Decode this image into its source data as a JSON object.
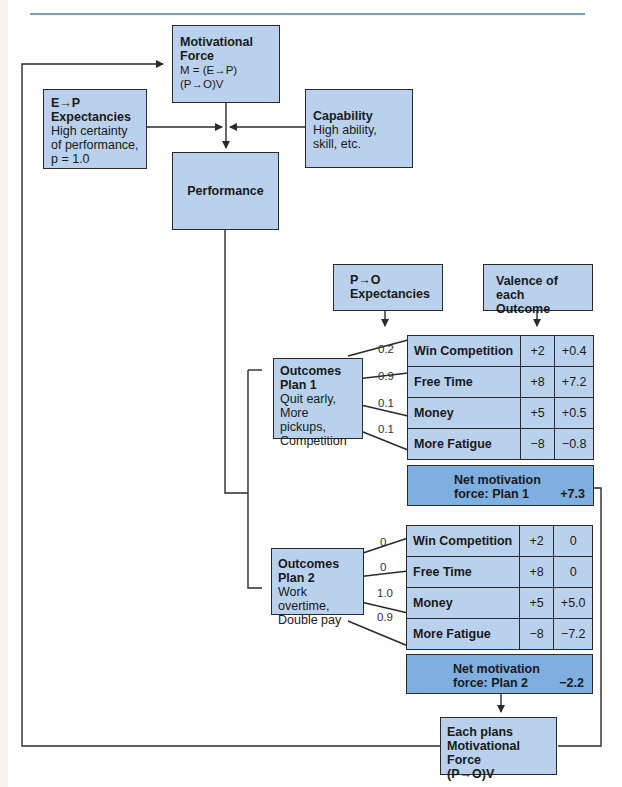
{
  "diagram": {
    "type": "flowchart",
    "colors": {
      "box_fill": "#b9d1ec",
      "net_fill": "#7faee0",
      "line": "#2a2a2a",
      "rule": "#6f9fcb"
    },
    "nodes": {
      "motivational_force": {
        "title": "Motivational Force",
        "formula": "M = (E→P)(P→O)V"
      },
      "ep_expectancies": {
        "title_line1": "E→P",
        "title_line2": "Expectancies",
        "body_line1": "High certainty",
        "body_line2": "of performance,",
        "body_line3": "p = 1.0"
      },
      "capability": {
        "title": "Capability",
        "body_line1": "High ability,",
        "body_line2": "skill, etc."
      },
      "performance": {
        "title": "Performance"
      },
      "po_expectancies": {
        "title_line1": "P→O",
        "title_line2": "Expectancies"
      },
      "valence": {
        "title_line1": "Valence of",
        "title_line2": "each Outcome"
      },
      "plan1": {
        "title_line1": "Outcomes",
        "title_line2": "Plan 1",
        "body_line1": "Quit early,",
        "body_line2": "More pickups,",
        "body_line3": "Competition"
      },
      "plan2": {
        "title_line1": "Outcomes",
        "title_line2": "Plan 2",
        "body_line1": "Work overtime,",
        "body_line2": "Double pay"
      },
      "each_plan": {
        "line1": "Each plans",
        "line2": "Motivational Force",
        "line3": "(P→O)V"
      }
    },
    "plan1_table": {
      "rows": [
        {
          "outcome": "Win Competition",
          "probability": "0.2",
          "valence": "+2",
          "product": "+0.4"
        },
        {
          "outcome": "Free Time",
          "probability": "0.9",
          "valence": "+8",
          "product": "+7.2"
        },
        {
          "outcome": "Money",
          "probability": "0.1",
          "valence": "+5",
          "product": "+0.5"
        },
        {
          "outcome": "More Fatigue",
          "probability": "0.1",
          "valence": "−8",
          "product": "−0.8"
        }
      ],
      "net_label_line1": "Net motivation",
      "net_label_line2": "force: Plan 1",
      "net_value": "+7.3"
    },
    "plan2_table": {
      "rows": [
        {
          "outcome": "Win Competition",
          "probability": "0",
          "valence": "+2",
          "product": "0"
        },
        {
          "outcome": "Free Time",
          "probability": "0",
          "valence": "+8",
          "product": "0"
        },
        {
          "outcome": "Money",
          "probability": "1.0",
          "valence": "+5",
          "product": "+5.0"
        },
        {
          "outcome": "More Fatigue",
          "probability": "0.9",
          "valence": "−8",
          "product": "−7.2"
        }
      ],
      "net_label_line1": "Net motivation",
      "net_label_line2": "force: Plan 2",
      "net_value": "−2.2"
    }
  }
}
